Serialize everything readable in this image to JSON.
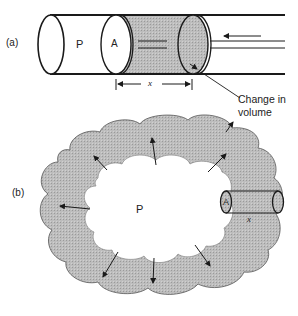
{
  "figure": {
    "panel_a": {
      "label": "(a)",
      "pressure_symbol": "P",
      "area_symbol": "A",
      "displacement_symbol": "x",
      "callout": {
        "line1": "Change in",
        "line2": "volume"
      }
    },
    "panel_b": {
      "label": "(b)",
      "pressure_symbol": "P",
      "area_symbol": "A",
      "displacement_symbol": "x"
    },
    "colors": {
      "ink": "#1a1a1a",
      "shading": "#b8b8b8",
      "background": "#ffffff"
    }
  }
}
